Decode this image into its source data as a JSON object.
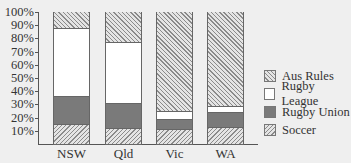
{
  "chart_data": {
    "type": "bar",
    "stacked": true,
    "title": "",
    "xlabel": "",
    "ylabel": "",
    "ylim": [
      0,
      100
    ],
    "yticks": [
      "10%",
      "20%",
      "30%",
      "40%",
      "50%",
      "60%",
      "70%",
      "80%",
      "90%",
      "100%"
    ],
    "categories": [
      "NSW",
      "Qld",
      "Vic",
      "WA"
    ],
    "series": [
      {
        "name": "Soccer",
        "pattern": "hatch-back",
        "values": [
          15,
          12,
          11,
          13
        ]
      },
      {
        "name": "Rugby Union",
        "color": "#7a7a7a",
        "values": [
          21,
          19,
          8,
          11
        ]
      },
      {
        "name": "Rugby League",
        "color": "#ffffff",
        "values": [
          52,
          46,
          6,
          5
        ]
      },
      {
        "name": "Aus Rules",
        "pattern": "hatch-forward",
        "values": [
          12,
          23,
          75,
          71
        ]
      }
    ],
    "legend": {
      "position": "right",
      "entries": [
        "Aus Rules",
        "Rugby League",
        "Rugby Union",
        "Soccer"
      ]
    },
    "grid": false
  }
}
